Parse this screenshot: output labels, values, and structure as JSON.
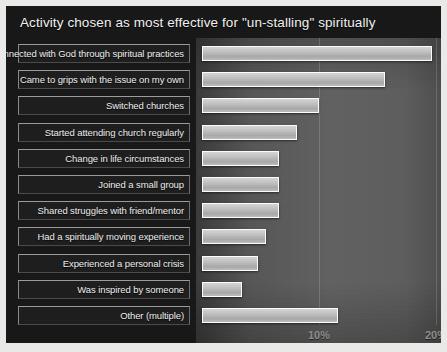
{
  "chart_data": {
    "type": "bar",
    "orientation": "horizontal",
    "title": "Activity chosen as most effective for \"un-stalling\" spiritually",
    "xlabel": "",
    "ylabel": "",
    "xlim": [
      0,
      20.6
    ],
    "grid": true,
    "legend": null,
    "tick_labels": [
      "10%",
      "20%"
    ],
    "tick_values": [
      10,
      20
    ],
    "categories": [
      "Connected with God through spiritual practices",
      "Came to grips with the issue on my own",
      "Switched churches",
      "Started attending church regularly",
      "Change in life circumstances",
      "Joined a small group",
      "Shared struggles with friend/mentor",
      "Had a spiritually moving experience",
      "Experienced a personal crisis",
      "Was inspired by someone",
      "Other (multiple)"
    ],
    "values": [
      19.7,
      15.6,
      10.0,
      8.1,
      6.6,
      6.6,
      6.6,
      5.5,
      4.8,
      3.4,
      11.6
    ]
  },
  "colors": {
    "panel_background": "#171717",
    "plot_background": "#5d5d5d",
    "bar_fill": "#bdbdbd",
    "bar_border": "#fdfdfd",
    "title_text": "#f2f2f2",
    "label_text": "#efefef",
    "axis_text": "#8d8d8d"
  }
}
